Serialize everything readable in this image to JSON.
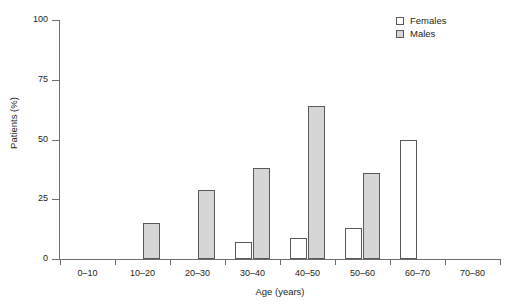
{
  "chart_data": {
    "type": "bar",
    "title": "",
    "subtitle": "",
    "xlabel": "Age (years)",
    "ylabel": "Patients (%)",
    "categories": [
      "0–10",
      "10–20",
      "20–30",
      "30–40",
      "40–50",
      "50–60",
      "60–70",
      "70–80"
    ],
    "series": [
      {
        "name": "Females",
        "values": [
          0,
          0,
          0,
          7,
          9,
          13,
          50,
          0
        ],
        "color": "#ffffff"
      },
      {
        "name": "Males",
        "values": [
          0,
          15,
          29,
          38,
          64,
          36,
          0,
          0
        ],
        "color": "#d6d6d6"
      }
    ],
    "ylim": [
      0,
      100
    ],
    "yticks": [
      0,
      25,
      50,
      75,
      100
    ],
    "ytick_labels": [
      "0",
      "25",
      "50",
      "75",
      "100"
    ],
    "grid": false,
    "legend_position": "top-right",
    "legend_entries": [
      "Females",
      "Males"
    ],
    "bar_edge_color": "#58595b",
    "axis_color": "#6d6e71",
    "text_color": "#231f20",
    "background": "#ffffff"
  }
}
